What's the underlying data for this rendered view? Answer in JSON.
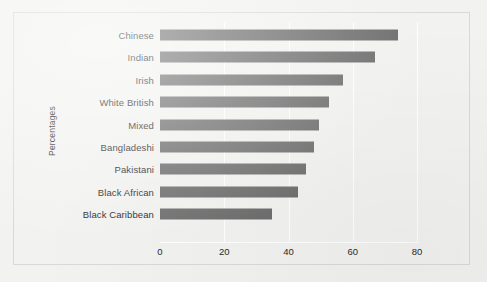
{
  "chart_data": {
    "type": "bar",
    "orientation": "horizontal",
    "title": "",
    "xlabel": "",
    "ylabel": "Percentages",
    "categories": [
      "Chinese",
      "Indian",
      "Irish",
      "White British",
      "Mixed",
      "Bangladeshi",
      "Pakistani",
      "Black African",
      "Black Caribbean"
    ],
    "values": [
      74,
      67,
      57,
      52.5,
      49.5,
      48,
      45.5,
      43,
      35
    ],
    "xticks": [
      "0",
      "20",
      "40",
      "60",
      "80"
    ],
    "xtick_values": [
      0,
      20,
      40,
      60,
      80
    ],
    "xlim": [
      0,
      80
    ],
    "grid": "vertical-white",
    "legend": "none",
    "bar_color": "#6e6e6e",
    "background_color": "#f2f2f0",
    "gridline_color": "#ffffff",
    "text_color": "#2a2a2a"
  }
}
